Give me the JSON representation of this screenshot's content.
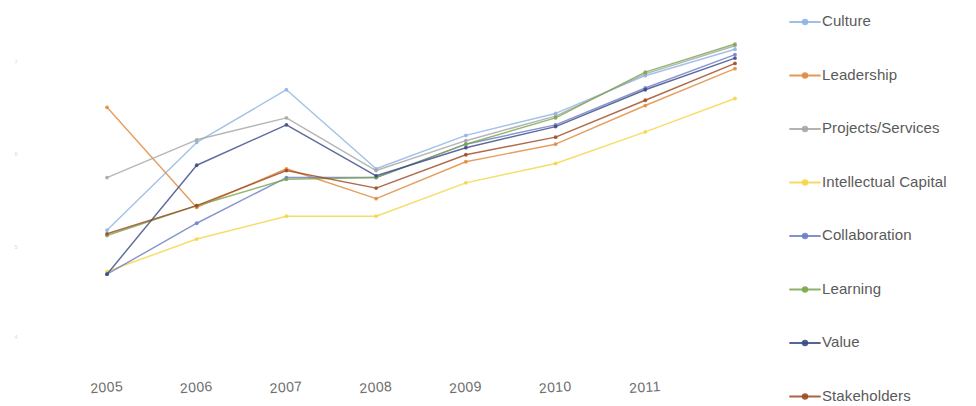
{
  "chart_data": {
    "type": "line",
    "title": "",
    "subtitle": "",
    "xlabel": "",
    "ylabel": "",
    "grid": false,
    "legend_position": "right",
    "x": [
      2005,
      2006,
      2007,
      2008,
      2009,
      2010,
      2011,
      2012
    ],
    "categories": [
      "2005",
      "2006",
      "2007",
      "2008",
      "2009",
      "2010",
      "2011",
      "2012"
    ],
    "xtick_labels": [
      "2005",
      "2006",
      "2007",
      "2008",
      "2009",
      "2010",
      "2011"
    ],
    "ytick_labels": [
      "7",
      "6",
      "5",
      "4"
    ],
    "ylim": [
      3.6,
      7.3
    ],
    "xlim": [
      2005,
      2012
    ],
    "series": [
      {
        "name": "Culture",
        "color": "#8eb4e3",
        "values": [
          5.02,
          6.02,
          6.62,
          5.72,
          6.1,
          6.35,
          6.78,
          7.08
        ]
      },
      {
        "name": "Leadership",
        "color": "#e08a3c",
        "values": [
          6.42,
          5.28,
          5.72,
          5.38,
          5.8,
          6.0,
          6.44,
          6.86
        ]
      },
      {
        "name": "Projects/Services",
        "color": "#a6a6a6",
        "values": [
          5.62,
          6.05,
          6.3,
          5.7,
          6.04,
          6.32,
          6.8,
          7.12
        ]
      },
      {
        "name": "Intellectual Capital",
        "color": "#f5d547",
        "values": [
          4.55,
          4.92,
          5.18,
          5.18,
          5.56,
          5.78,
          6.14,
          6.52
        ]
      },
      {
        "name": "Collaboration",
        "color": "#6d7fc4",
        "values": [
          4.52,
          5.1,
          5.62,
          5.62,
          6.0,
          6.22,
          6.64,
          7.02
        ]
      },
      {
        "name": "Learning",
        "color": "#7ba64f",
        "values": [
          4.96,
          5.3,
          5.6,
          5.62,
          6.0,
          6.3,
          6.82,
          7.14
        ]
      },
      {
        "name": "Value",
        "color": "#3a4a86",
        "values": [
          4.52,
          5.76,
          6.22,
          5.64,
          5.96,
          6.2,
          6.62,
          6.98
        ]
      },
      {
        "name": "Stakeholders",
        "color": "#9c4a23",
        "values": [
          4.98,
          5.3,
          5.7,
          5.5,
          5.88,
          6.08,
          6.5,
          6.92
        ]
      }
    ]
  },
  "legend": {
    "items": [
      {
        "label": "Culture"
      },
      {
        "label": "Leadership"
      },
      {
        "label": "Projects/Services"
      },
      {
        "label": "Intellectual Capital"
      },
      {
        "label": "Collaboration"
      },
      {
        "label": "Learning"
      },
      {
        "label": "Value"
      },
      {
        "label": "Stakeholders"
      }
    ]
  }
}
